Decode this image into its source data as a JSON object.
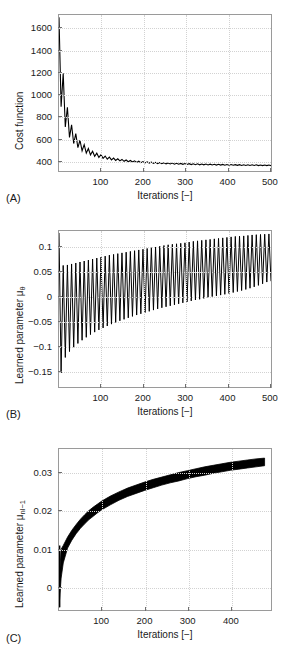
{
  "figure": {
    "background": "#ffffff",
    "curve_color": "#000000",
    "axis_color": "#9a9a9a",
    "grid_color": "#d2d2d2"
  },
  "panels": [
    {
      "tag": "(A)",
      "ylabel": "Cost function",
      "ylabel_sub": "",
      "xlabel": "Iterations [−]",
      "yticks": [
        "400",
        "600",
        "800",
        "1000",
        "1200",
        "1400",
        "1600"
      ],
      "ytick_values": [
        400,
        600,
        800,
        1000,
        1200,
        1400,
        1600
      ],
      "xticks": [
        "100",
        "200",
        "300",
        "400",
        "500"
      ],
      "xtick_values": [
        100,
        200,
        300,
        400,
        500
      ]
    },
    {
      "tag": "(B)",
      "ylabel": "Learned parameter μ",
      "ylabel_sub": "θ",
      "xlabel": "Iterations [−]",
      "yticks": [
        "0.1",
        "0.05",
        "0",
        "−0.05",
        "−0.1",
        "−0.15"
      ],
      "ytick_values": [
        0.1,
        0.05,
        0,
        -0.05,
        -0.1,
        -0.15
      ],
      "xticks": [
        "100",
        "200",
        "300",
        "400",
        "500"
      ],
      "xtick_values": [
        100,
        200,
        300,
        400,
        500
      ]
    },
    {
      "tag": "(C)",
      "ylabel": "Learned parameter μ",
      "ylabel_sub": "nl−1",
      "xlabel": "Iterations [−]",
      "yticks": [
        "0.03",
        "0.02",
        "0.01",
        "0"
      ],
      "ytick_values": [
        0.03,
        0.02,
        0.01,
        0
      ],
      "xticks": [
        "100",
        "200",
        "300",
        "400"
      ],
      "xtick_values": [
        100,
        200,
        300,
        400
      ]
    }
  ],
  "chart_data": [
    {
      "type": "line",
      "panel": "(A)",
      "title": "",
      "xlabel": "Iterations [−]",
      "ylabel": "Cost function",
      "xlim": [
        0,
        505
      ],
      "ylim": [
        300,
        1720
      ],
      "grid": true,
      "legend": null,
      "description": "Rapidly decaying cost with superimposed high-frequency oscillation settling to a plateau near 330.",
      "series": [
        {
          "name": "cost",
          "envelope_upper": [
            1700,
            1190,
            880,
            720,
            640,
            580,
            540,
            505,
            480,
            462,
            448,
            436,
            426,
            418,
            411,
            405,
            400,
            396,
            392,
            389,
            386,
            383,
            381,
            379,
            377,
            375,
            373,
            372,
            370,
            369,
            368,
            367,
            366,
            365,
            364,
            363,
            362,
            361,
            361,
            360,
            359,
            359,
            358,
            358,
            357,
            357,
            356,
            356,
            355,
            355,
            355
          ],
          "envelope_lower": [
            1010,
            760,
            640,
            572,
            528,
            496,
            472,
            454,
            440,
            428,
            419,
            411,
            404,
            399,
            394,
            390,
            386,
            383,
            380,
            377,
            375,
            373,
            371,
            369,
            367,
            366,
            364,
            363,
            362,
            361,
            360,
            359,
            358,
            357,
            356,
            356,
            355,
            354,
            354,
            353,
            353,
            352,
            352,
            351,
            351,
            350,
            350,
            350,
            349,
            349,
            349
          ],
          "x_envelope": [
            0,
            10,
            20,
            30,
            40,
            50,
            60,
            70,
            80,
            90,
            100,
            110,
            120,
            130,
            140,
            150,
            160,
            170,
            180,
            190,
            200,
            210,
            220,
            230,
            240,
            250,
            260,
            270,
            280,
            290,
            300,
            310,
            320,
            330,
            340,
            350,
            360,
            370,
            380,
            390,
            400,
            410,
            420,
            430,
            440,
            450,
            460,
            470,
            480,
            490,
            500
          ],
          "oscillation_period": 10,
          "final_value": 330
        }
      ]
    },
    {
      "type": "line",
      "panel": "(B)",
      "title": "",
      "xlabel": "Iterations [−]",
      "ylabel": "Learned parameter μ_θ",
      "xlim": [
        0,
        505
      ],
      "ylim": [
        -0.185,
        0.132
      ],
      "grid": true,
      "legend": null,
      "description": "High-frequency oscillating parameter whose envelope drifts upward; lower bound rises from -0.18 toward 0.03 while the upper bound rises from 0.06 to 0.125.",
      "series": [
        {
          "name": "mu_theta",
          "x_envelope": [
            0,
            10,
            20,
            30,
            40,
            50,
            60,
            70,
            80,
            90,
            100,
            120,
            140,
            160,
            180,
            200,
            220,
            240,
            260,
            280,
            300,
            320,
            340,
            360,
            380,
            400,
            420,
            440,
            460,
            480,
            500
          ],
          "envelope_upper": [
            0.128,
            0.062,
            0.063,
            0.065,
            0.067,
            0.069,
            0.071,
            0.073,
            0.075,
            0.077,
            0.079,
            0.083,
            0.086,
            0.089,
            0.092,
            0.095,
            0.098,
            0.101,
            0.104,
            0.106,
            0.108,
            0.111,
            0.113,
            0.115,
            0.117,
            0.119,
            0.121,
            0.122,
            0.124,
            0.125,
            0.126
          ],
          "envelope_lower": [
            -0.181,
            -0.132,
            -0.118,
            -0.108,
            -0.1,
            -0.093,
            -0.087,
            -0.081,
            -0.076,
            -0.071,
            -0.067,
            -0.059,
            -0.052,
            -0.046,
            -0.04,
            -0.035,
            -0.03,
            -0.025,
            -0.021,
            -0.017,
            -0.013,
            -0.009,
            -0.006,
            -0.002,
            0.001,
            0.004,
            0.008,
            0.012,
            0.017,
            0.023,
            0.03
          ],
          "oscillation_period": 10
        }
      ]
    },
    {
      "type": "line",
      "panel": "(C)",
      "title": "",
      "xlabel": "Iterations [−]",
      "ylabel": "Learned parameter μ_nl−1",
      "xlim": [
        0,
        495
      ],
      "ylim": [
        -0.0062,
        0.0362
      ],
      "grid": true,
      "legend": null,
      "description": "Thick oscillating band rising logarithmically from about -0.005 to a saturating value near 0.035.",
      "series": [
        {
          "name": "mu_nl_minus_1",
          "x_envelope": [
            0,
            5,
            10,
            20,
            30,
            40,
            50,
            60,
            70,
            80,
            90,
            100,
            120,
            140,
            160,
            180,
            200,
            220,
            240,
            260,
            280,
            300,
            320,
            340,
            360,
            380,
            400,
            420,
            440,
            460,
            480
          ],
          "envelope_upper": [
            0.0005,
            0.0098,
            0.0108,
            0.013,
            0.0148,
            0.0163,
            0.0177,
            0.0189,
            0.02,
            0.0209,
            0.0217,
            0.0225,
            0.0238,
            0.0249,
            0.0259,
            0.0267,
            0.0275,
            0.0282,
            0.0288,
            0.0294,
            0.03,
            0.0305,
            0.031,
            0.0315,
            0.0319,
            0.0323,
            0.0327,
            0.033,
            0.0333,
            0.0336,
            0.0338
          ],
          "envelope_lower": [
            -0.0055,
            0.0022,
            0.0062,
            0.0101,
            0.0122,
            0.0139,
            0.0153,
            0.0165,
            0.0176,
            0.0185,
            0.0194,
            0.0202,
            0.0215,
            0.0227,
            0.0237,
            0.0245,
            0.0253,
            0.026,
            0.0267,
            0.0273,
            0.0278,
            0.0284,
            0.0289,
            0.0293,
            0.0298,
            0.0302,
            0.0306,
            0.0309,
            0.0312,
            0.0315,
            0.0318
          ],
          "oscillation_period": 8
        }
      ]
    }
  ]
}
